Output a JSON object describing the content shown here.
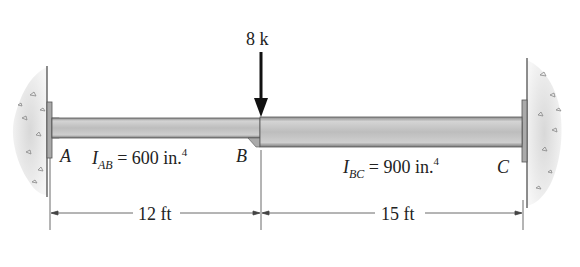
{
  "load": {
    "label": "8 k"
  },
  "points": {
    "a": "A",
    "b": "B",
    "c": "C"
  },
  "segments": {
    "ab": {
      "symbol": "I",
      "subscript": "AB",
      "eq": "= 600 in.",
      "exp": "4"
    },
    "bc": {
      "symbol": "I",
      "subscript": "BC",
      "eq": "= 900 in.",
      "exp": "4"
    }
  },
  "dimensions": {
    "ab": "12 ft",
    "bc": "15 ft"
  },
  "colors": {
    "beam": "#b9b9b9",
    "beam_dark": "#8c8c8c",
    "wall": "#d9d9d9",
    "line": "#333333"
  }
}
